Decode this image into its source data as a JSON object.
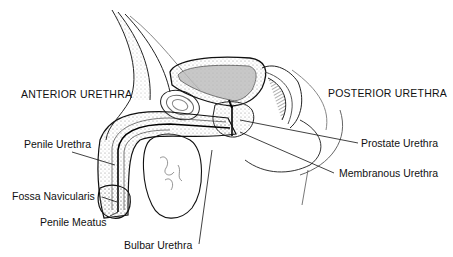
{
  "figure": {
    "colors": {
      "ink": "#111111",
      "shade": "#555555",
      "background": "#ffffff"
    }
  },
  "headings": {
    "anterior": "ANTERIOR URETHRA",
    "posterior": "POSTERIOR  URETHRA"
  },
  "labels": {
    "penile_urethra": "Penile Urethra",
    "fossa_navicularis": "Fossa Navicularis",
    "penile_meatus": "Penile Meatus",
    "bulbar_urethra": "Bulbar Urethra",
    "prostate_urethra": "Prostate Urethra",
    "membranous_urethra": "Membranous Urethra"
  }
}
